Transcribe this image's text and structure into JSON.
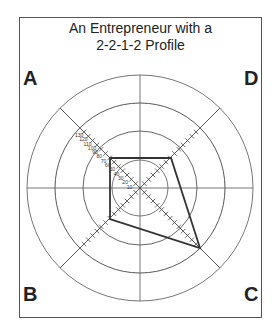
{
  "title_line1": "An Entrepreneur with a",
  "title_line2": "2-2-1-2 Profile",
  "quadrants": {
    "A": "A",
    "B": "B",
    "C": "C",
    "D": "D"
  },
  "scale_labels": [
    "10",
    "20",
    "30",
    "40",
    "50",
    "60",
    "70",
    "80",
    "90",
    "100",
    "110",
    "120",
    "130"
  ],
  "profile_values": {
    "A": 50,
    "B": 50,
    "C": 100,
    "D": 50
  }
}
